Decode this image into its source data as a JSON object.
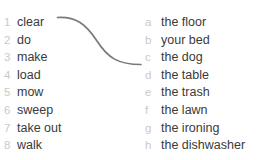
{
  "exercise": {
    "clipped_header": "",
    "background_color": "#ffffff",
    "marker_color": "#c9c9c9",
    "text_color": "#3a3a3a",
    "connector_color": "#7a7a7a"
  },
  "left_column": {
    "items": [
      {
        "marker": "1",
        "phrase": "clear"
      },
      {
        "marker": "2",
        "phrase": "do"
      },
      {
        "marker": "3",
        "phrase": "make"
      },
      {
        "marker": "4",
        "phrase": "load"
      },
      {
        "marker": "5",
        "phrase": "mow"
      },
      {
        "marker": "6",
        "phrase": "sweep"
      },
      {
        "marker": "7",
        "phrase": "take out"
      },
      {
        "marker": "8",
        "phrase": "walk"
      }
    ]
  },
  "right_column": {
    "items": [
      {
        "marker": "a",
        "phrase": "the floor"
      },
      {
        "marker": "b",
        "phrase": "your bed"
      },
      {
        "marker": "c",
        "phrase": "the dog"
      },
      {
        "marker": "d",
        "phrase": "the table"
      },
      {
        "marker": "e",
        "phrase": "the trash"
      },
      {
        "marker": "f",
        "phrase": "the lawn"
      },
      {
        "marker": "g",
        "phrase": "the ironing"
      },
      {
        "marker": "h",
        "phrase": "the dishwasher"
      }
    ]
  },
  "connections": [
    {
      "from": "1",
      "to": "d"
    }
  ]
}
